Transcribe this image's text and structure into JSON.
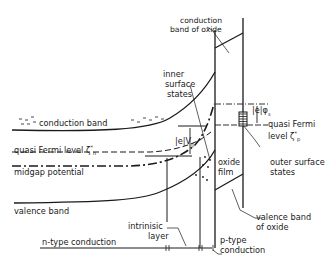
{
  "diagram": {
    "title": "",
    "colors": {
      "line": "#1a1a1a",
      "background": "#ffffff"
    },
    "labels": {
      "conduction_band_oxide_1": "conduction",
      "conduction_band_oxide_2": "band of oxide",
      "inner_surface_states_1": "inner",
      "inner_surface_states_2": "surface",
      "inner_surface_states_3": "states",
      "conduction_band": "conduction band",
      "qf_right_eph": "|e|φ",
      "qf_right_eph_sub": "s",
      "quasi_fermi_right_1": "quasi Fermi",
      "quasi_fermi_right_2": "level ζ",
      "quasi_fermi_right_sub": "p",
      "quasi_fermi_right_sup": "*",
      "quasi_fermi_left": "quasi Fermi level ζ",
      "quasi_fermi_left_sub": "n",
      "quasi_fermi_left_sup": "*",
      "ev0": "|e|V",
      "ev0_sub": "0",
      "midgap_potential": "midgap potential",
      "oxide_film_1": "oxide",
      "oxide_film_2": "film",
      "outer_surface_states_1": "outer surface",
      "outer_surface_states_2": "states",
      "valence_band": "valence band",
      "valence_band_oxide_1": "valence band",
      "valence_band_oxide_2": "of oxide",
      "intrinsic_layer_1": "intrinisic",
      "intrinsic_layer_2": "layer",
      "n_type_conduction": "n-type conduction",
      "p_type_conduction_1": "p-type",
      "p_type_conduction_2": "conduction"
    }
  }
}
